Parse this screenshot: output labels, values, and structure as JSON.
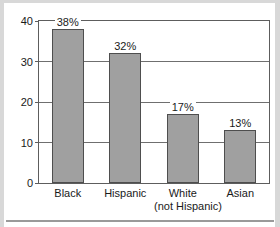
{
  "chart_data": {
    "type": "bar",
    "title": "",
    "subtitle": "",
    "xlabel": "",
    "ylabel": "",
    "categories": [
      "Black",
      "Hispanic",
      "White (not Hispanic)",
      "Asian"
    ],
    "category_lines": [
      [
        "Black"
      ],
      [
        "Hispanic"
      ],
      [
        "White",
        "(not Hispanic)"
      ],
      [
        "Asian"
      ]
    ],
    "values": [
      38,
      32,
      17,
      13
    ],
    "data_labels": [
      "38%",
      "32%",
      "17%",
      "13%"
    ],
    "ylim": [
      0,
      40
    ],
    "yticks": [
      0,
      10,
      20,
      30,
      40
    ],
    "ytick_labels": [
      "0",
      "10",
      "20",
      "30",
      "40"
    ],
    "grid": true,
    "grid_axis": "y",
    "legend": false,
    "colors": {
      "bar_fill": "#a0a0a0",
      "bar_stroke": "#4e4e4e",
      "gridline": "#6f6f6f",
      "frame": "#5d5d5d",
      "text": "#1a1a1a",
      "background": "#ffffff",
      "page_edge": "#d8d8d8",
      "rule": "#9a9a9a"
    }
  }
}
